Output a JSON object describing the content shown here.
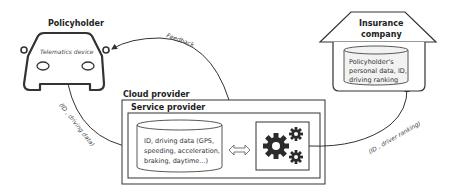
{
  "policyholder": {
    "title": "Policyholder",
    "device_label": "Telematics device"
  },
  "cloud": {
    "title": "Cloud provider",
    "service": {
      "title": "Service provider",
      "database": {
        "lines": [
          "ID, driving data (GPS,",
          "speeding, acceleration,",
          "braking, daytime...)"
        ]
      },
      "processing_icon": "gears-icon",
      "exchange_icon": "double-arrow-icon"
    }
  },
  "insurer": {
    "title_line1": "Insurance",
    "title_line2": "company",
    "database": {
      "lines": [
        "Policyholder's",
        "personal data, ID,",
        "driving ranking"
      ]
    }
  },
  "flows": {
    "feedback": "Feedback",
    "driving_data": "(ID , driving data)",
    "driver_ranking": "(ID , driver ranking)"
  },
  "colors": {
    "stroke": "#333333",
    "fill_light": "#f2f2f2",
    "gear": "#2b2b2b"
  }
}
